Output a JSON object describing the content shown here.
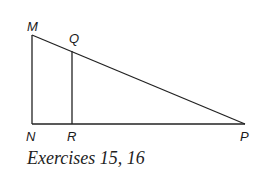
{
  "diagram": {
    "type": "geometry-figure",
    "points": [
      {
        "name": "M",
        "label": "M",
        "x": 32,
        "y": 35
      },
      {
        "name": "N",
        "label": "N",
        "x": 32,
        "y": 124
      },
      {
        "name": "R",
        "label": "R",
        "x": 72,
        "y": 124
      },
      {
        "name": "Q",
        "label": "Q",
        "x": 72,
        "y": 51
      },
      {
        "name": "P",
        "label": "P",
        "x": 245,
        "y": 124
      }
    ],
    "segments": [
      {
        "from": "M",
        "to": "N"
      },
      {
        "from": "N",
        "to": "P"
      },
      {
        "from": "M",
        "to": "P"
      },
      {
        "from": "Q",
        "to": "R"
      }
    ],
    "colors": {
      "line": "#222222",
      "text": "#1a1a1a",
      "background": "#ffffff"
    }
  },
  "labels": {
    "M": "M",
    "Q": "Q",
    "N": "N",
    "R": "R",
    "P": "P"
  },
  "caption": "Exercises 15, 16"
}
